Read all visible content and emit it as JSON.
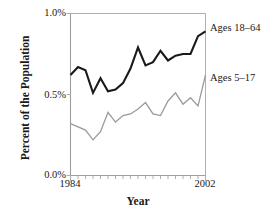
{
  "chart_data": {
    "type": "line",
    "title": "",
    "xlabel": "Year",
    "ylabel": "Percent of the Population",
    "xlim": [
      1984,
      2002
    ],
    "ylim": [
      0.0,
      1.0
    ],
    "grid": false,
    "legend_position": "right-inline",
    "x": [
      1984,
      1985,
      1986,
      1987,
      1988,
      1989,
      1990,
      1991,
      1992,
      1993,
      1994,
      1995,
      1996,
      1997,
      1998,
      1999,
      2000,
      2001,
      2002
    ],
    "xtick_labels": [
      "1984",
      "2002"
    ],
    "xtick_values": [
      1984,
      2002
    ],
    "ytick_labels": [
      "0.0%",
      "0.5%",
      "1.0%"
    ],
    "ytick_values": [
      0.0,
      0.5,
      1.0
    ],
    "series": [
      {
        "name": "Ages 18-64",
        "label": "Ages 18–64",
        "color": "#1a1a1a",
        "width": 2.1,
        "values": [
          0.62,
          0.67,
          0.65,
          0.51,
          0.6,
          0.52,
          0.53,
          0.57,
          0.66,
          0.79,
          0.68,
          0.7,
          0.77,
          0.71,
          0.74,
          0.75,
          0.75,
          0.86,
          0.89
        ]
      },
      {
        "name": "Ages 5-17",
        "label": "Ages 5–17",
        "color": "#9a9a9a",
        "width": 1.3,
        "values": [
          0.32,
          0.3,
          0.28,
          0.22,
          0.27,
          0.39,
          0.33,
          0.37,
          0.38,
          0.41,
          0.45,
          0.38,
          0.37,
          0.46,
          0.51,
          0.44,
          0.48,
          0.43,
          0.62
        ]
      }
    ]
  },
  "axis": {
    "ylabel": "Percent of the Population",
    "xlabel": "Year",
    "ytick_top": "1.0%",
    "ytick_mid": "0.5%",
    "ytick_bottom": "0.0%",
    "xtick_left": "1984",
    "xtick_right": "2002"
  },
  "legend": {
    "upper_label": "Ages 18–64",
    "lower_label": "Ages 5–17"
  },
  "colors": {
    "adults_line": "#1a1a1a",
    "children_line": "#9a9a9a",
    "axis": "#b0b0b0",
    "text": "#1a1a1a",
    "background": "#ffffff"
  }
}
